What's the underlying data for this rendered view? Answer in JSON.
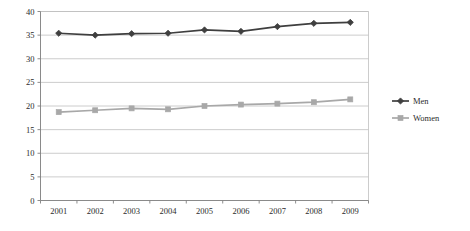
{
  "chart_data": {
    "type": "line",
    "title": "",
    "subtitle": "",
    "xlabel": "",
    "ylabel": "",
    "categories": [
      "2001",
      "2002",
      "2003",
      "2004",
      "2005",
      "2006",
      "2007",
      "2008",
      "2009"
    ],
    "series": [
      {
        "name": "Men",
        "color": "#3f3f3f",
        "marker": "diamond",
        "values": [
          35.4,
          35.0,
          35.3,
          35.4,
          36.1,
          35.8,
          36.8,
          37.5,
          37.7
        ]
      },
      {
        "name": "Women",
        "color": "#a8a8a8",
        "marker": "square",
        "values": [
          18.7,
          19.1,
          19.5,
          19.3,
          20.0,
          20.3,
          20.5,
          20.8,
          21.4
        ]
      }
    ],
    "ylim": [
      0,
      40
    ],
    "ytick_values": [
      0,
      5,
      10,
      15,
      20,
      25,
      30,
      35,
      40
    ],
    "ytick_labels": [
      "0",
      "5",
      "10",
      "15",
      "20",
      "25",
      "30",
      "35",
      "40"
    ],
    "grid": true,
    "grid_axis": "y",
    "grid_color": "#bfbfbf",
    "axis_color": "#808080",
    "legend": {
      "position": "right",
      "entries": [
        "Men",
        "Women"
      ]
    },
    "plot_background": "#ffffff"
  }
}
